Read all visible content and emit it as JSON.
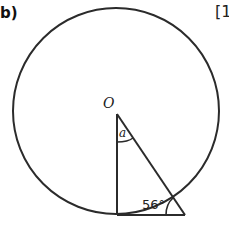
{
  "question": {
    "part_label": "b)",
    "marks_label": "[1"
  },
  "diagram": {
    "circle": {
      "cx": 116,
      "cy": 111,
      "r": 103
    },
    "center_label": "O",
    "angle_at_center_label": "a",
    "angle_at_base_label": "56°",
    "stroke_color": "#2b2b2b"
  }
}
